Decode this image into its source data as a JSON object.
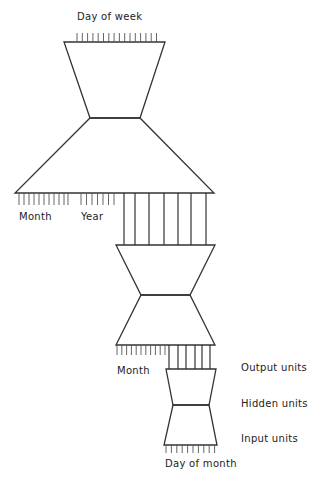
{
  "diagram": {
    "title": "",
    "labels": {
      "day_of_week": "Day of week",
      "month_top": "Month",
      "year": "Year",
      "month_mid": "Month",
      "output_units": "Output units",
      "hidden_units": "Hidden units",
      "input_units": "Input units",
      "day_of_month": "Day of month"
    },
    "modules": [
      {
        "name": "day-of-week-network",
        "output": "Day of week",
        "inputs": [
          "Month",
          "Year",
          "lower-network-outputs"
        ]
      },
      {
        "name": "month-network",
        "output": "Month",
        "inputs": [
          "lower-network-outputs"
        ]
      },
      {
        "name": "day-of-month-network",
        "output": "lower-network-outputs",
        "inputs": [
          "Day of month"
        ]
      }
    ],
    "legend": [
      "Output units",
      "Hidden units",
      "Input units"
    ],
    "colors": {
      "stroke": "#333333",
      "background": "#ffffff"
    }
  }
}
